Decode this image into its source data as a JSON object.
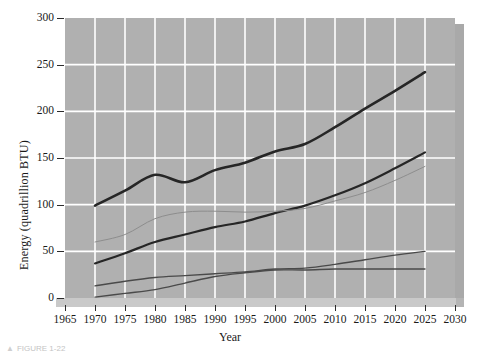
{
  "figure": {
    "caption_marker": "▲",
    "caption_text": "FIGURE 1-22"
  },
  "chart_data": {
    "type": "line",
    "title": "",
    "xlabel": "Year",
    "ylabel": "Energy (quadrillion BTU)",
    "xlim": [
      1965,
      2030
    ],
    "ylim": [
      0,
      300
    ],
    "xticks": [
      1965,
      1970,
      1975,
      1980,
      1985,
      1990,
      1995,
      2000,
      2005,
      2010,
      2015,
      2020,
      2025,
      2030
    ],
    "yticks": [
      0,
      50,
      100,
      150,
      200,
      250,
      300
    ],
    "xtick_labels": [
      "1965",
      "1970",
      "1975",
      "1980",
      "1985",
      "1990",
      "1995",
      "2000",
      "2005",
      "2010",
      "2015",
      "2020",
      "2025",
      "2030"
    ],
    "ytick_labels": [
      "0",
      "50",
      "100",
      "150",
      "200",
      "250",
      "300"
    ],
    "grid": true,
    "grid_color": "#ffffff",
    "panel_color": "#b0b0b0",
    "legend": "none",
    "x": [
      1970,
      1975,
      1980,
      1985,
      1990,
      1995,
      2000,
      2005,
      2010,
      2015,
      2020,
      2025
    ],
    "series": [
      {
        "name": "total-energy",
        "style": "thick-dark",
        "color": "#262626",
        "width": 2.6,
        "values": [
          99,
          115,
          132,
          124,
          137,
          145,
          157,
          165,
          183,
          203,
          222,
          242
        ]
      },
      {
        "name": "upper-mid-energy",
        "style": "thick-dark",
        "color": "#262626",
        "width": 2.2,
        "values": [
          37,
          48,
          60,
          68,
          76,
          82,
          91,
          99,
          110,
          123,
          139,
          156
        ]
      },
      {
        "name": "thin-light-energy",
        "style": "thin-light",
        "color": "#8d8d8d",
        "width": 1.0,
        "values": [
          60,
          68,
          85,
          92,
          93,
          92,
          93,
          96,
          104,
          113,
          126,
          141
        ]
      },
      {
        "name": "lower-energy-a",
        "style": "medium-dark",
        "color": "#4a4a4a",
        "width": 1.4,
        "values": [
          13,
          18,
          22,
          24,
          26,
          28,
          31,
          32,
          36,
          41,
          46,
          50
        ]
      },
      {
        "name": "lower-energy-b",
        "style": "medium-dark",
        "color": "#4a4a4a",
        "width": 1.4,
        "values": [
          1,
          5,
          9,
          16,
          23,
          27,
          30,
          30,
          31,
          31,
          31,
          31
        ]
      }
    ]
  }
}
